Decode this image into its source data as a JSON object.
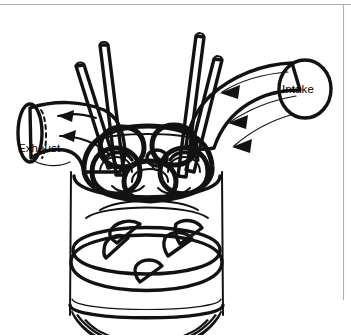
{
  "figure": {
    "background_color": "#ffffff",
    "ink_color": "#121212",
    "frame_color": "#aab0b4",
    "width": 351,
    "height": 336
  },
  "labels": {
    "intake": "Intake",
    "exhaust": "Exhaust"
  },
  "diagram": {
    "intake_port": {
      "name": "Intake",
      "opening_shape": "circle",
      "opening_center": [
        305,
        89
      ],
      "opening_radius_x": 26,
      "opening_radius_y": 29,
      "flow_direction": "into-chamber",
      "arrow_count": 3
    },
    "exhaust_port": {
      "name": "Exhaust",
      "opening_shape": "ellipse",
      "opening_center": [
        30,
        133
      ],
      "opening_radius_x": 12,
      "opening_radius_y": 30,
      "flow_direction": "out-of-chamber",
      "arrow_count": 2,
      "hidden_edge": "dashed"
    },
    "valves": {
      "count": 4,
      "arrangement": "two-intake-two-exhaust",
      "stem_tips": [
        [
          104,
          45
        ],
        [
          80,
          66
        ],
        [
          200,
          36
        ],
        [
          218,
          59
        ]
      ]
    },
    "spark_plug": {
      "position": [
        157,
        162
      ],
      "location": "chamber-center"
    },
    "piston": {
      "crown_center": [
        146,
        256
      ],
      "valve_relief_pockets": 4,
      "shape": "flat-top-with-reliefs"
    },
    "cylinder": {
      "wall_left_x": 71,
      "wall_right_x": 222,
      "top_y": 168,
      "bottom_y": 318,
      "cutaway_hatching": true
    }
  }
}
